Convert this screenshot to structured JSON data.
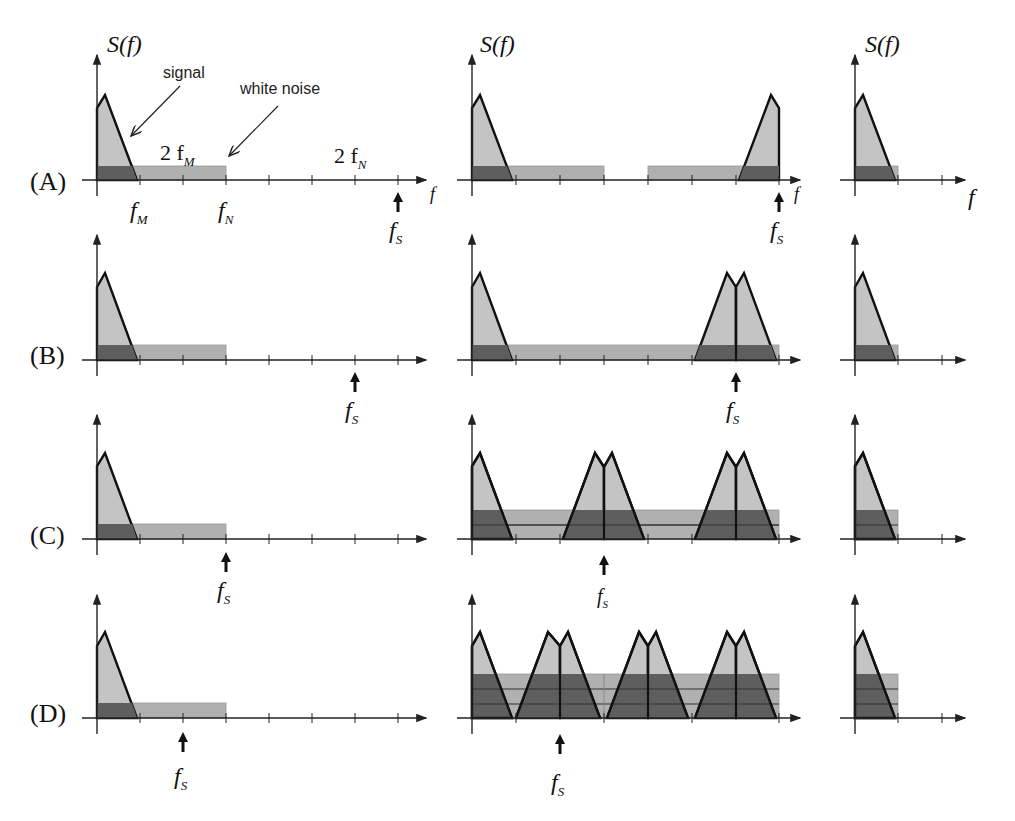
{
  "figure": {
    "y_axis_label": "S(f)",
    "x_axis_label": "f",
    "annotations": {
      "signal": "signal",
      "white_noise": "white noise",
      "two_fM": "2 f",
      "two_fM_sub": "M",
      "two_fN": "2 f",
      "two_fN_sub": "N",
      "fM": "f",
      "fM_sub": "M",
      "fN": "f",
      "fN_sub": "N"
    },
    "fs_label": "f",
    "fs_sub": "S",
    "rows": [
      {
        "id": "A",
        "label": "(A)",
        "fs_tick": 7
      },
      {
        "id": "B",
        "label": "(B)",
        "fs_tick": 6
      },
      {
        "id": "C",
        "label": "(C)",
        "fs_tick": 3
      },
      {
        "id": "D",
        "label": "(D)",
        "fs_tick": 2
      }
    ],
    "columns": [
      "original spectrum with noise",
      "sampled spectrum (aliasing)",
      "baseband after filtering"
    ],
    "colors": {
      "signal_fill": "#c4c4c4",
      "noise_fill": "#b0b0b0",
      "overlap_fill": "#5e5e5e",
      "outline": "#111111"
    }
  }
}
